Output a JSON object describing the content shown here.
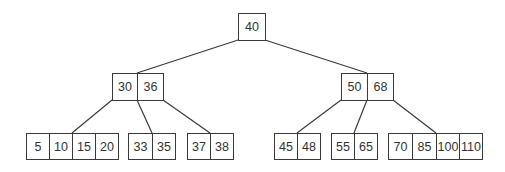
{
  "diagram": {
    "type": "b-tree",
    "colors": {
      "line": "#3a3a3a",
      "text": "#333333",
      "background": "#ffffff"
    },
    "root": {
      "keys": [
        "40"
      ]
    },
    "internal": [
      {
        "keys": [
          "30",
          "36"
        ]
      },
      {
        "keys": [
          "50",
          "68"
        ]
      }
    ],
    "leaves": [
      {
        "keys": [
          "5",
          "10",
          "15",
          "20"
        ]
      },
      {
        "keys": [
          "33",
          "35"
        ]
      },
      {
        "keys": [
          "37",
          "38"
        ]
      },
      {
        "keys": [
          "45",
          "48"
        ]
      },
      {
        "keys": [
          "55",
          "65"
        ]
      },
      {
        "keys": [
          "70",
          "85",
          "100",
          "110"
        ]
      }
    ]
  }
}
